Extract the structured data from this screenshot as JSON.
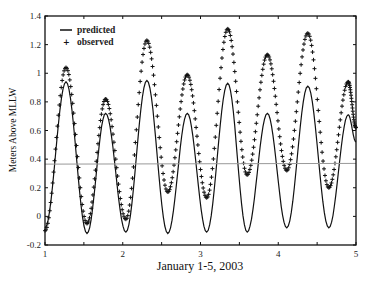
{
  "chart_data": {
    "type": "line",
    "title": "",
    "xlabel": "January 1-5, 2003",
    "ylabel": "Meters Above MLLW",
    "xlim": [
      1,
      5
    ],
    "ylim": [
      -0.2,
      1.4
    ],
    "x_ticks": [
      1,
      2,
      3,
      4,
      5
    ],
    "x_minor_ticks": [
      1.5,
      2.5,
      3.5,
      4.5
    ],
    "x_tick_labels": [
      "1",
      "2",
      "3",
      "4",
      "5"
    ],
    "y_ticks": [
      -0.2,
      0,
      0.2,
      0.4,
      0.6,
      0.8,
      1,
      1.2,
      1.4
    ],
    "y_tick_labels": [
      "-0.2",
      "0",
      "0.2",
      "0.4",
      "0.6",
      "0.8",
      "1",
      "1.2",
      "1.4"
    ],
    "grid": false,
    "legend": {
      "position": "top-left",
      "entries": [
        "predicted",
        "observed"
      ]
    },
    "series": [
      {
        "name": "predicted",
        "style": "solid-line",
        "extrema_x": [
          1.0,
          1.27,
          1.54,
          1.78,
          2.04,
          2.31,
          2.58,
          2.83,
          3.08,
          3.35,
          3.6,
          3.86,
          4.11,
          4.38,
          4.65,
          4.9,
          5.0
        ],
        "extrema_y": [
          -0.08,
          0.94,
          -0.12,
          0.72,
          -0.11,
          0.95,
          -0.12,
          0.72,
          -0.11,
          0.93,
          -0.11,
          0.72,
          -0.08,
          0.91,
          -0.08,
          0.71,
          0.52
        ]
      },
      {
        "name": "observed",
        "style": "plus-markers",
        "extrema_x": [
          1.0,
          1.27,
          1.54,
          1.78,
          2.04,
          2.31,
          2.58,
          2.83,
          3.08,
          3.35,
          3.6,
          3.86,
          4.11,
          4.38,
          4.65,
          4.9,
          5.0
        ],
        "extrema_y": [
          -0.1,
          1.04,
          -0.05,
          0.82,
          -0.02,
          1.23,
          0.17,
          0.99,
          0.13,
          1.31,
          0.29,
          1.13,
          0.32,
          1.28,
          0.2,
          0.94,
          0.62
        ]
      },
      {
        "name": "reference-level",
        "style": "gray-line",
        "x": [
          1,
          5
        ],
        "y": [
          0.365,
          0.37
        ]
      }
    ]
  },
  "colors": {
    "predicted": "#111111",
    "observed": "#111111",
    "reference": "#999999",
    "axis": "#111111"
  }
}
